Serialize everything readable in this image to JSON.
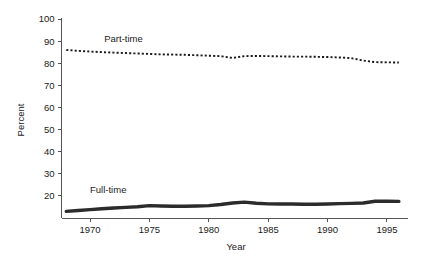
{
  "chart_data": {
    "type": "line",
    "title": "",
    "xlabel": "Year",
    "ylabel": "Percent",
    "xlim": [
      1967.6,
      1996.6
    ],
    "ylim": [
      10,
      100
    ],
    "grid": false,
    "legend": "inline-labels",
    "xticks": [
      1970,
      1975,
      1980,
      1985,
      1990,
      1995
    ],
    "xtick_labels": [
      "1970",
      "1975",
      "1980",
      "1985",
      "1990",
      "1995"
    ],
    "yticks": [
      20,
      30,
      40,
      50,
      60,
      70,
      80,
      90,
      100
    ],
    "ytick_labels": [
      "20",
      "30",
      "40",
      "50",
      "60",
      "70",
      "80",
      "90",
      "100"
    ],
    "x": [
      1968,
      1969,
      1970,
      1971,
      1972,
      1973,
      1974,
      1975,
      1976,
      1977,
      1978,
      1979,
      1980,
      1981,
      1982,
      1983,
      1984,
      1985,
      1986,
      1987,
      1988,
      1989,
      1990,
      1991,
      1992,
      1993,
      1994,
      1995,
      1996
    ],
    "series": [
      {
        "name": "Part-time",
        "style": "dotted",
        "color": "#1a1a1a",
        "label_x": 1971.2,
        "label_y": 89.5,
        "values": [
          86.0,
          85.6,
          85.3,
          85.0,
          84.8,
          84.6,
          84.4,
          84.2,
          84.0,
          83.9,
          83.8,
          83.6,
          83.4,
          83.2,
          82.4,
          83.2,
          83.3,
          83.2,
          83.1,
          83.0,
          83.0,
          82.9,
          82.8,
          82.6,
          82.3,
          81.2,
          80.5,
          80.4,
          80.3
        ]
      },
      {
        "name": "Full-time",
        "style": "solid-thick",
        "color": "#2b2b2b",
        "label_x": 1970.0,
        "label_y": 21.5,
        "values": [
          13.0,
          13.4,
          13.8,
          14.2,
          14.5,
          14.8,
          15.1,
          15.6,
          15.4,
          15.3,
          15.3,
          15.4,
          15.6,
          16.1,
          16.8,
          17.2,
          16.7,
          16.4,
          16.3,
          16.3,
          16.2,
          16.2,
          16.3,
          16.5,
          16.6,
          16.8,
          17.6,
          17.6,
          17.5
        ]
      }
    ]
  },
  "axes": {
    "y_axis_title": "Percent",
    "x_axis_title": "Year"
  }
}
